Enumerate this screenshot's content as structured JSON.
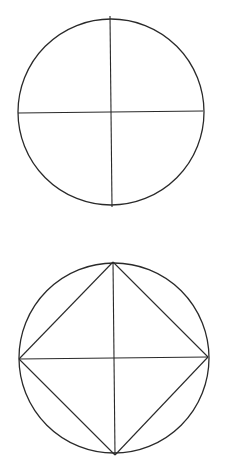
{
  "diagram": {
    "background": "#ffffff",
    "stroke_color": "#2a2a2a",
    "figures": [
      {
        "name": "circle-with-diameters",
        "circle": {
          "cx": 111,
          "cy": 112,
          "r": 93
        },
        "lines": [
          {
            "x1": 110,
            "y1": 16,
            "x2": 112,
            "y2": 207
          },
          {
            "x1": 18,
            "y1": 113,
            "x2": 203,
            "y2": 111
          }
        ]
      },
      {
        "name": "circle-with-inscribed-square",
        "circle": {
          "cx": 114,
          "cy": 358,
          "r": 95
        },
        "lines": [
          {
            "x1": 113,
            "y1": 262,
            "x2": 115,
            "y2": 455
          },
          {
            "x1": 19,
            "y1": 359,
            "x2": 208,
            "y2": 357
          },
          {
            "x1": 113,
            "y1": 262,
            "x2": 208,
            "y2": 357
          },
          {
            "x1": 208,
            "y1": 357,
            "x2": 115,
            "y2": 455
          },
          {
            "x1": 115,
            "y1": 455,
            "x2": 19,
            "y2": 359
          },
          {
            "x1": 19,
            "y1": 359,
            "x2": 113,
            "y2": 262
          }
        ]
      }
    ]
  }
}
